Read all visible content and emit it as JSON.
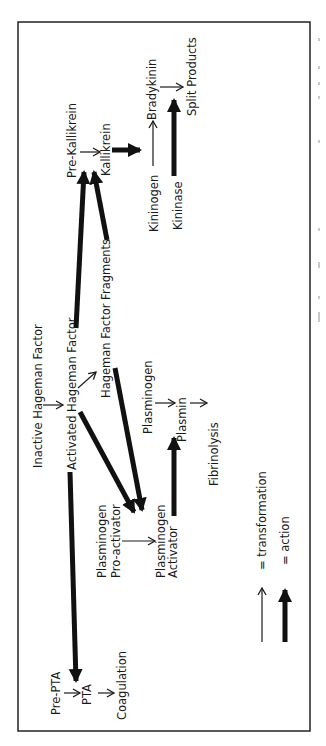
{
  "figure": {
    "frame": {
      "stroke": "#222222",
      "background": "#ffffff"
    },
    "orientation": "rotated-90-ccw",
    "nodes": {
      "inactive_hf": "Inactive Hageman Factor",
      "activated_hf": "Activated Hageman Factor",
      "hf_fragments": "Hageman Factor Fragments",
      "pre_kallikrein": "Pre-Kallikrein",
      "kallikrein": "Kallikrein",
      "kininogen": "Kininogen",
      "bradykinin": "Bradykinin",
      "kininase": "Kininase",
      "split_products": "Split Products",
      "plasminogen": "Plasminogen",
      "plasmin": "Plasmin",
      "fibrinolysis": "Fibrinolysis",
      "pro_activator_line1": "Plasminogen",
      "pro_activator_line2": "Pro-activator",
      "activator_line1": "Plasminogen",
      "activator_line2": "Activator",
      "pre_pta": "Pre-PTA",
      "pta": "PTA",
      "coagulation": "Coagulation"
    },
    "edges": [
      {
        "from": "Inactive Hageman Factor",
        "to": "Activated Hageman Factor",
        "type": "transformation"
      },
      {
        "from": "Activated Hageman Factor",
        "to": "Hageman Factor Fragments",
        "type": "transformation"
      },
      {
        "from": "Activated Hageman Factor",
        "to": "Pre-Kallikrein",
        "type": "action"
      },
      {
        "from": "Hageman Factor Fragments",
        "to": "Pre-Kallikrein",
        "type": "action"
      },
      {
        "from": "Pre-Kallikrein",
        "to": "Kallikrein",
        "type": "transformation"
      },
      {
        "from": "Kallikrein",
        "to": "Kininogen→Bradykinin",
        "type": "action"
      },
      {
        "from": "Kininogen",
        "to": "Bradykinin",
        "type": "transformation"
      },
      {
        "from": "Bradykinin",
        "to": "Split Products",
        "type": "transformation"
      },
      {
        "from": "Kininase",
        "to": "Bradykinin→Split Products",
        "type": "action"
      },
      {
        "from": "Activated Hageman Factor",
        "to": "Plasminogen Pro-activator",
        "type": "action"
      },
      {
        "from": "Hageman Factor Fragments",
        "to": "Plasminogen Pro-activator",
        "type": "action"
      },
      {
        "from": "Plasminogen Pro-activator",
        "to": "Plasminogen Activator",
        "type": "transformation"
      },
      {
        "from": "Plasminogen Activator",
        "to": "Plasminogen→Plasmin",
        "type": "action"
      },
      {
        "from": "Plasminogen",
        "to": "Plasmin",
        "type": "transformation"
      },
      {
        "from": "Plasmin",
        "to": "Fibrinolysis",
        "type": "transformation"
      },
      {
        "from": "Activated Hageman Factor",
        "to": "Pre-PTA",
        "type": "action"
      },
      {
        "from": "Pre-PTA",
        "to": "PTA",
        "type": "transformation"
      },
      {
        "from": "PTA",
        "to": "Coagulation",
        "type": "transformation"
      }
    ],
    "legend": {
      "transformation": "= transformation",
      "action": "= action"
    }
  }
}
